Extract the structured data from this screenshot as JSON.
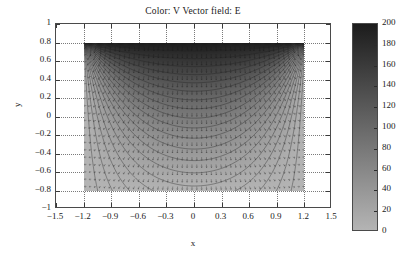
{
  "figure": {
    "title": "Color: V Vector field: E",
    "background": "#ffffff",
    "axis_color": "#4a4a4a",
    "grid_color": "#7a7a7a",
    "contour_color": "#202020",
    "arrow_color": "#151515"
  },
  "axes": {
    "xlabel": "x",
    "ylabel": "y",
    "xlim": [
      -1.5,
      1.5
    ],
    "ylim": [
      -1,
      1
    ],
    "xticks": [
      -1.5,
      -1.2,
      -0.9,
      -0.6,
      -0.3,
      0,
      0.3,
      0.6,
      0.9,
      1.2,
      1.5
    ],
    "xticklabels": [
      "-1.5",
      "-1.2",
      "-0.9",
      "-0.6",
      "-0.3",
      "0",
      "0.3",
      "0.6",
      "0.9",
      "1.2",
      "1.5"
    ],
    "yticks": [
      -1,
      -0.8,
      -0.6,
      -0.4,
      -0.2,
      0,
      0.2,
      0.4,
      0.6,
      0.8,
      1
    ],
    "yticklabels": [
      "-1",
      "-0.8",
      "-0.6",
      "-0.4",
      "-0.2",
      "0",
      "0.2",
      "0.4",
      "0.6",
      "0.8",
      "1"
    ],
    "grid": true,
    "grid_style": "dotted"
  },
  "colorbar": {
    "min": 0,
    "max": 200,
    "ticks": [
      200,
      180,
      160,
      140,
      120,
      100,
      80,
      60,
      40,
      20,
      0
    ],
    "ticklabels": [
      "200",
      "180",
      "160",
      "140",
      "120",
      "100",
      "80",
      "60",
      "40",
      "20",
      "0"
    ],
    "colormap": "gray-inverted",
    "top_color": "#1c1c1c",
    "bottom_color": "#b4b4b4",
    "position": "right"
  },
  "chart_data": {
    "type": "heatmap",
    "title": "Color: V Vector field: E",
    "xlabel": "x",
    "ylabel": "y",
    "xlim": [
      -1.5,
      1.5
    ],
    "ylim": [
      -1,
      1
    ],
    "grid": true,
    "legend": "none",
    "color_variable": "V",
    "vector_variable": "E",
    "domain": {
      "x_min": -1.2,
      "x_max": 1.2,
      "y_min": -0.8,
      "y_max": 0.8
    },
    "value_range": [
      0,
      200
    ],
    "boundary_conditions": {
      "top": 200,
      "bottom": 0,
      "left": 0,
      "right": 0
    },
    "contour_levels": [
      10,
      20,
      30,
      40,
      50,
      60,
      70,
      80,
      90,
      100,
      110,
      120,
      130,
      140,
      150,
      160,
      170,
      180,
      190
    ]
  }
}
